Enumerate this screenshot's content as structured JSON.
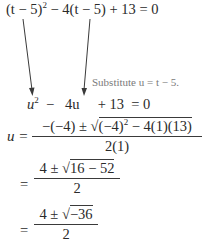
{
  "equation_line_1": {
    "lhs_part1": "(t − 5)",
    "lhs_part1_exp": "2",
    "lhs_part2": " − 4(t − 5) + 13  = 0"
  },
  "substitution_note": "Substitute u = t − 5.",
  "equation_line_2": {
    "u_term": "u",
    "u_exp": "2",
    "rest": "  −   4u     + 13  = 0"
  },
  "quadratic_formula": {
    "lhs": "u =",
    "numerator_pre": "−(−4) ± ",
    "radicand_pre": "(−4)",
    "radicand_exp": "2",
    "radicand_post": " − 4(1)(13)",
    "denominator": "2(1)"
  },
  "step_2": {
    "eq": "=",
    "numerator_pre": "4 ± ",
    "radicand": "16 − 52",
    "denominator": "2"
  },
  "step_3": {
    "eq": "=",
    "numerator_pre": "4 ± ",
    "radicand": "−36",
    "denominator": "2"
  },
  "arrows": [
    {
      "name": "arrow-left",
      "from": [
        23,
        19
      ],
      "to": [
        32,
        96
      ]
    },
    {
      "name": "arrow-right",
      "from": [
        90,
        19
      ],
      "to": [
        84,
        96
      ]
    }
  ],
  "colors": {
    "text": "#2a2a2a",
    "note": "#7a7a7a",
    "arrow": "#3a3a3a"
  }
}
